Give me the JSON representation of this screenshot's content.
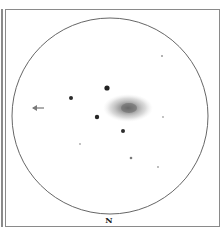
{
  "sketch": {
    "orientation_label": "N",
    "field_circle": {
      "cx": 110,
      "cy": 116,
      "r": 98,
      "stroke": "#555555"
    },
    "galaxy": {
      "cx": 128,
      "cy": 108,
      "rx": 25,
      "ry": 14,
      "core_color": "#6e6e6e",
      "halo_color": "#bdbdbd"
    },
    "stars": [
      {
        "x": 107,
        "y": 88,
        "r": 2.6,
        "shade": "#222222"
      },
      {
        "x": 71,
        "y": 98,
        "r": 2.0,
        "shade": "#2a2a2a"
      },
      {
        "x": 97,
        "y": 117,
        "r": 2.2,
        "shade": "#262626"
      },
      {
        "x": 123,
        "y": 131,
        "r": 2.0,
        "shade": "#2e2e2e"
      },
      {
        "x": 162,
        "y": 56,
        "r": 1.0,
        "shade": "#9a9a9a"
      },
      {
        "x": 163,
        "y": 117,
        "r": 0.9,
        "shade": "#a8a8a8"
      },
      {
        "x": 80,
        "y": 144,
        "r": 0.9,
        "shade": "#a8a8a8"
      },
      {
        "x": 131,
        "y": 158,
        "r": 1.3,
        "shade": "#7a7a7a"
      },
      {
        "x": 158,
        "y": 167,
        "r": 0.9,
        "shade": "#a0a0a0"
      }
    ],
    "arrow": {
      "x": 38,
      "y": 108,
      "direction": "left",
      "color": "#8a8a8a"
    }
  }
}
